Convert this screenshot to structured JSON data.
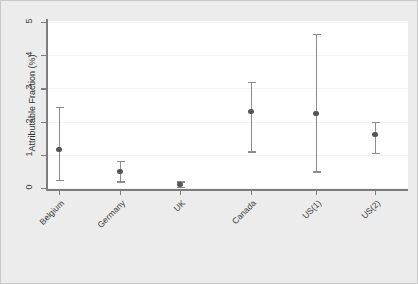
{
  "chart_data": {
    "type": "scatter",
    "title": "",
    "subtitle": "",
    "xlabel": "",
    "ylabel": "Attributable Fraction (%)",
    "ylim": [
      0,
      5
    ],
    "yticks": [
      0,
      1,
      2,
      3,
      4,
      5
    ],
    "ytick_labels": [
      "0",
      "1",
      "2",
      "3",
      "4",
      "5"
    ],
    "grid": true,
    "grid_axis": "y",
    "legend": "none",
    "marker": "filled-circle",
    "error_bars": "vertical-ci-with-caps",
    "categories": [
      "Belgium",
      "Germany",
      "UK",
      "Canada",
      "US(1)",
      "US(2)"
    ],
    "series": [
      {
        "name": "Attributable Fraction",
        "values": [
          1.15,
          0.5,
          0.1,
          2.3,
          2.25,
          1.6
        ],
        "ci_low": [
          0.25,
          0.2,
          0.03,
          1.1,
          0.5,
          1.05
        ],
        "ci_high": [
          2.45,
          0.82,
          0.2,
          3.2,
          4.65,
          2.0
        ]
      }
    ],
    "points": [
      {
        "category": "Belgium",
        "value": 1.15,
        "ci_low": 0.25,
        "ci_high": 2.45
      },
      {
        "category": "Germany",
        "value": 0.5,
        "ci_low": 0.2,
        "ci_high": 0.82
      },
      {
        "category": "UK",
        "value": 0.1,
        "ci_low": 0.03,
        "ci_high": 0.2
      },
      {
        "category": "Canada",
        "value": 2.3,
        "ci_low": 1.1,
        "ci_high": 3.2
      },
      {
        "category": "US(1)",
        "value": 2.25,
        "ci_low": 0.5,
        "ci_high": 4.65
      },
      {
        "category": "US(2)",
        "value": 1.6,
        "ci_low": 1.05,
        "ci_high": 2.0
      }
    ]
  },
  "colors": {
    "figure_background": "#ececec",
    "plot_background": "#ffffff",
    "axis": "#7d7d7d",
    "gridline": "#f2f2f2",
    "marker": "#555555",
    "error_bar": "#8c8c8c",
    "text": "#3a3a3a",
    "border": "#c9c9c9"
  }
}
